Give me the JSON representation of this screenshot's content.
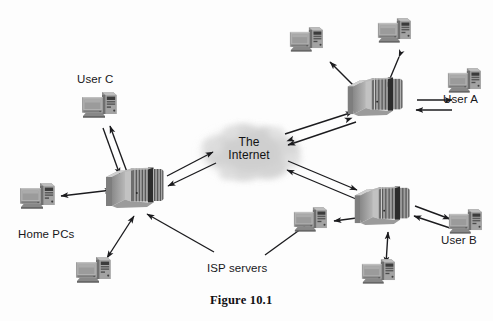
{
  "figure": {
    "caption": "Figure 10.1",
    "caption_pos": {
      "x": 210,
      "y": 293
    },
    "width": 493,
    "height": 321,
    "background": "#fdfdfd"
  },
  "palette": {
    "line": "#1b1b1e",
    "text": "#17171a",
    "cloud_fill": "#d4d4d4",
    "cloud_fill_light": "#e2e2e2",
    "device_dark": "#2b2b2b",
    "device_mid": "#8f8f8f",
    "device_light": "#c9c9c9",
    "pc_screen": "#b4b4b4",
    "pc_body": "#9a9a9a",
    "pc_dark": "#454545"
  },
  "cloud": {
    "label_line1": "The",
    "label_line2": "Internet",
    "center": {
      "x": 249,
      "y": 152
    },
    "rx": 52,
    "ry": 29
  },
  "labels": [
    {
      "name": "user-c-label",
      "text": "User C",
      "x": 77,
      "y": 73
    },
    {
      "name": "user-a-label",
      "text": "User A",
      "x": 443,
      "y": 93
    },
    {
      "name": "user-b-label",
      "text": "User B",
      "x": 441,
      "y": 234
    },
    {
      "name": "home-pcs-label",
      "text": "Home PCs",
      "x": 18,
      "y": 228
    },
    {
      "name": "isp-servers-label",
      "text": "ISP servers",
      "x": 207,
      "y": 262
    }
  ],
  "routers": [
    {
      "name": "router-left",
      "id": "isp-left",
      "x": 128,
      "y": 186,
      "scale": 1.0
    },
    {
      "name": "router-top-right",
      "id": "isp-top-right",
      "x": 374,
      "y": 96,
      "scale": 0.95
    },
    {
      "name": "router-bottom-right",
      "id": "isp-bottom-right",
      "x": 381,
      "y": 205,
      "scale": 0.95
    }
  ],
  "computers": [
    {
      "name": "pc-user-c",
      "id": "user-c",
      "x": 96,
      "y": 103,
      "scale": 1.0
    },
    {
      "name": "pc-home-left",
      "id": "home-left",
      "x": 34,
      "y": 192,
      "scale": 1.0
    },
    {
      "name": "pc-home-bottom",
      "id": "home-bottom",
      "x": 90,
      "y": 266,
      "scale": 1.0
    },
    {
      "name": "pc-top-far-left",
      "id": "top-left",
      "x": 306,
      "y": 37,
      "scale": 0.95
    },
    {
      "name": "pc-top-right",
      "id": "top-right",
      "x": 392,
      "y": 30,
      "scale": 0.95
    },
    {
      "name": "pc-user-a",
      "id": "user-a",
      "x": 459,
      "y": 80,
      "scale": 0.95
    },
    {
      "name": "pc-mid-left",
      "id": "mid-left",
      "x": 307,
      "y": 218,
      "scale": 0.95
    },
    {
      "name": "pc-user-b",
      "id": "user-b",
      "x": 460,
      "y": 221,
      "scale": 0.95
    },
    {
      "name": "pc-bottom-center",
      "id": "bottom-center",
      "x": 374,
      "y": 269,
      "scale": 0.95
    }
  ],
  "connections": [
    {
      "name": "link-userc-routerleft-out",
      "from": "user-c",
      "to": "isp-left",
      "style": "single-arrow"
    },
    {
      "name": "link-userc-routerleft-in",
      "from": "isp-left",
      "to": "user-c",
      "style": "single-arrow"
    },
    {
      "name": "link-homeleft-routerleft",
      "from": "home-left",
      "to": "isp-left",
      "style": "double-arrow"
    },
    {
      "name": "link-homebottom-routerleft",
      "from": "isp-left",
      "to": "home-bottom",
      "style": "double-arrow"
    },
    {
      "name": "link-routerleft-cloud-out",
      "from": "isp-left",
      "to": "cloud",
      "style": "single-arrow"
    },
    {
      "name": "link-cloud-routerleft-in",
      "from": "cloud",
      "to": "isp-left",
      "style": "single-arrow"
    },
    {
      "name": "link-cloud-routertopright-out",
      "from": "cloud",
      "to": "isp-top-right",
      "style": "single-arrow"
    },
    {
      "name": "link-routertopright-cloud-in",
      "from": "isp-top-right",
      "to": "cloud",
      "style": "single-arrow"
    },
    {
      "name": "link-cloud-routerbottomright-out",
      "from": "cloud",
      "to": "isp-bottom-right",
      "style": "single-arrow"
    },
    {
      "name": "link-routerbottomright-cloud-in",
      "from": "isp-bottom-right",
      "to": "cloud",
      "style": "single-arrow"
    },
    {
      "name": "link-topleft-routertopright",
      "from": "top-left",
      "to": "isp-top-right",
      "style": "double-arrow"
    },
    {
      "name": "link-topright-routertopright",
      "from": "top-right",
      "to": "isp-top-right",
      "style": "double-arrow"
    },
    {
      "name": "link-usera-routertopright-out",
      "from": "user-a",
      "to": "isp-top-right",
      "style": "single-arrow"
    },
    {
      "name": "link-routertopright-usera-in",
      "from": "isp-top-right",
      "to": "user-a",
      "style": "single-arrow"
    },
    {
      "name": "link-midleft-routerbottomright",
      "from": "mid-left",
      "to": "isp-bottom-right",
      "style": "double-arrow"
    },
    {
      "name": "link-userb-routerbottomright-out",
      "from": "isp-bottom-right",
      "to": "user-b",
      "style": "single-arrow"
    },
    {
      "name": "link-userb-routerbottomright-in",
      "from": "user-b",
      "to": "isp-bottom-right",
      "style": "single-arrow"
    },
    {
      "name": "link-bottomcenter-routerbottomright",
      "from": "bottom-center",
      "to": "isp-bottom-right",
      "style": "double-arrow"
    },
    {
      "name": "leader-isp-to-routerleft",
      "from": "isp-servers-label",
      "to": "isp-left",
      "style": "leader-arrow"
    },
    {
      "name": "leader-isp-to-routerbottomright",
      "from": "isp-servers-label",
      "to": "isp-bottom-right",
      "style": "leader-plain"
    }
  ]
}
